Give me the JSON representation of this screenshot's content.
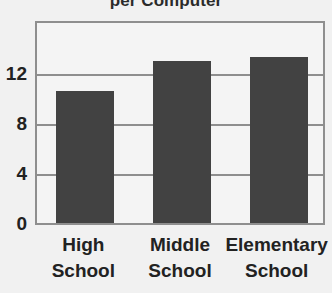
{
  "chart_data": {
    "type": "bar",
    "title": "per Computer",
    "title_note": "Title is cropped by the top edge of the screenshot; only the trailing words are visible.",
    "xlabel": "",
    "ylabel": "",
    "categories": [
      "High School",
      "Middle School",
      "Elementary School"
    ],
    "category_lines": [
      {
        "line1": "High",
        "line2": "School"
      },
      {
        "line1": "Middle",
        "line2": "School"
      },
      {
        "line1": "Elementary",
        "line2": "School"
      }
    ],
    "values": [
      10.6,
      13.0,
      13.3
    ],
    "yticks": [
      0,
      4,
      8,
      12
    ],
    "ytick_labels": [
      "0",
      "4",
      "8",
      "12"
    ],
    "ylim": [
      0,
      16.2
    ],
    "grid": true,
    "grid_axis": "y",
    "legend": null,
    "legend_position": "none",
    "colors": {
      "bar": "#424242",
      "plot_background": "#f4f4f4",
      "page_background": "#f1f1f1",
      "axis": "#8e8e8e",
      "text": "#222222",
      "title_text": "#2b2b2b"
    }
  }
}
